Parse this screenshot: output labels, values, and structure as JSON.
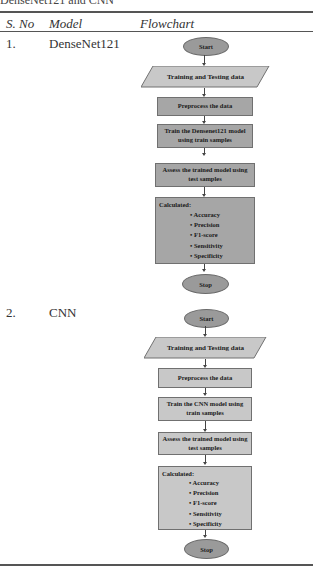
{
  "caption_fragment": "DenseNet121 and CNN",
  "table": {
    "headers": {
      "sno": "S. No",
      "model": "Model",
      "flowchart": "Flowchart"
    },
    "rows": [
      {
        "sno": "1.",
        "model": "DenseNet121",
        "flowchart": {
          "start": "Start",
          "input": "Training and Testing data",
          "preprocess": "Preprocess the data",
          "train_line1": "Train the Densenet121 model",
          "train_line2": "using train samples",
          "assess_line1": "Assess the trained model using",
          "assess_line2": "test samples",
          "calculated_title": "Calculated:",
          "metrics": [
            "Accuracy",
            "Precision",
            "F1-score",
            "Sensitivity",
            "Specificity"
          ],
          "stop": "Stop"
        }
      },
      {
        "sno": "2.",
        "model": "CNN",
        "flowchart": {
          "start": "Start",
          "input": "Training and Testing data",
          "preprocess": "Preprocess the data",
          "train_line1": "Train the CNN model using",
          "train_line2": "train samples",
          "assess_line1": "Assess the trained model using",
          "assess_line2": "test samples",
          "calculated_title": "Calculated:",
          "metrics": [
            "Accuracy",
            "Precision",
            "F1-score",
            "Sensitivity",
            "Specificity"
          ],
          "stop": "Stop"
        }
      }
    ]
  },
  "colors": {
    "dark_fill": "#a6a6a6",
    "light_fill": "#c8c8c8",
    "oval_fill": "#9a9a9a",
    "rule": "#555555"
  }
}
